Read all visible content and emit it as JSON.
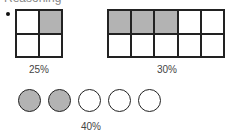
{
  "header": {
    "clipped_text": "Reasoning"
  },
  "figures": [
    {
      "id": "grid-a",
      "type": "grid",
      "rows": 2,
      "cols": 2,
      "shaded_cells": [
        1
      ],
      "label": "25%"
    },
    {
      "id": "grid-b",
      "type": "grid",
      "rows": 2,
      "cols": 5,
      "shaded_cells": [
        0,
        1,
        2
      ],
      "label": "30%"
    },
    {
      "id": "circles",
      "type": "circles",
      "count": 5,
      "shaded": [
        0,
        1
      ],
      "label": "40%"
    }
  ],
  "colors": {
    "shade": "#b3b3b3",
    "stroke": "#222222",
    "background": "#ffffff"
  }
}
